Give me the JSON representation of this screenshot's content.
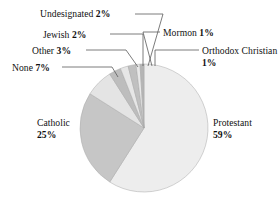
{
  "chart_data": {
    "type": "pie",
    "title": "",
    "xlabel": "",
    "ylabel": "",
    "legend_position": "none",
    "grid": false,
    "categories": [
      "Protestant",
      "Catholic",
      "None",
      "Other",
      "Jewish",
      "Undesignated",
      "Mormon",
      "Orthodox Christian"
    ],
    "values": [
      59,
      25,
      7,
      3,
      2,
      2,
      1,
      1
    ],
    "value_suffix": "%",
    "slices": [
      {
        "name": "Protestant",
        "value": 59,
        "label_value": "59%",
        "color": "#ededed",
        "start_angle": 0,
        "end_angle": 212.4,
        "label_id": "label-protestant",
        "label_lines": [
          "Protestant",
          "59%"
        ]
      },
      {
        "name": "Catholic",
        "value": 25,
        "label_value": "25%",
        "color": "#c6c6c6",
        "start_angle": 212.4,
        "end_angle": 302.4,
        "label_id": "label-catholic",
        "label_lines": [
          "Catholic",
          "25%"
        ]
      },
      {
        "name": "None",
        "value": 7,
        "label_value": "7%",
        "color": "#e4e4e4",
        "start_angle": 302.4,
        "end_angle": 327.6,
        "label_id": "label-none",
        "label_lines": [
          "None 7%"
        ]
      },
      {
        "name": "Other",
        "value": 3,
        "label_value": "3%",
        "color": "#bdbdbd",
        "start_angle": 327.6,
        "end_angle": 338.4,
        "label_id": "label-other",
        "label_lines": [
          "Other 3%"
        ]
      },
      {
        "name": "Jewish",
        "value": 2,
        "label_value": "2%",
        "color": "#e6e6e6",
        "start_angle": 338.4,
        "end_angle": 345.6,
        "label_id": "label-jewish",
        "label_lines": [
          "Jewish 2%"
        ]
      },
      {
        "name": "Undesignated",
        "value": 2,
        "label_value": "2%",
        "color": "#c0c0c0",
        "start_angle": 345.6,
        "end_angle": 352.8,
        "label_id": "label-undesignated",
        "label_lines": [
          "Undesignated 2%"
        ]
      },
      {
        "name": "Mormon",
        "value": 1,
        "label_value": "1%",
        "color": "#e8e8e8",
        "start_angle": 352.8,
        "end_angle": 356.4,
        "label_id": "label-mormon",
        "label_lines": [
          "Mormon 1%"
        ]
      },
      {
        "name": "Orthodox Christian",
        "value": 1,
        "label_value": "1%",
        "color": "#b5b5b5",
        "start_angle": 356.4,
        "end_angle": 360,
        "label_id": "label-orthodox",
        "label_lines": [
          "Orthodox Christian",
          "1%"
        ]
      }
    ]
  },
  "labels": {
    "protestant": {
      "name": "Protestant",
      "pct": "59%"
    },
    "catholic": {
      "name": "Catholic",
      "pct": "25%"
    },
    "none": {
      "name": "None",
      "pct": "7%"
    },
    "other": {
      "name": "Other",
      "pct": "3%"
    },
    "jewish": {
      "name": "Jewish",
      "pct": "2%"
    },
    "undesignated": {
      "name": "Undesignated",
      "pct": "2%"
    },
    "mormon": {
      "name": "Mormon",
      "pct": "1%"
    },
    "orthodox": {
      "name": "Orthodox Christian",
      "pct": "1%"
    }
  },
  "colors": {
    "protestant": "#ededed",
    "catholic": "#c6c6c6",
    "none": "#e4e4e4",
    "other": "#bdbdbd",
    "jewish": "#e6e6e6",
    "undesignated": "#c0c0c0",
    "mormon": "#e8e8e8",
    "orthodox": "#b5b5b5",
    "leader_line": "#5a5a5a",
    "slice_outline": "#a8a8a8",
    "text": "#111111",
    "background": "#ffffff"
  }
}
